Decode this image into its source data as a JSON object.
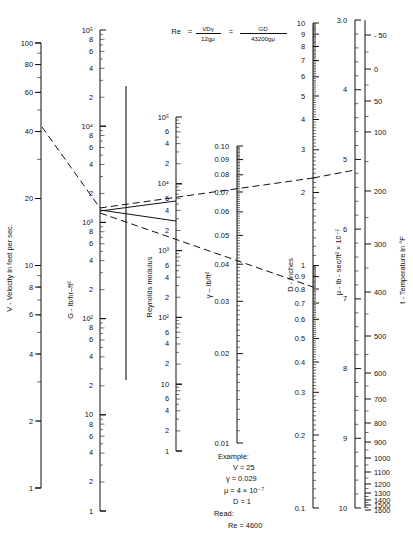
{
  "figure": {
    "kind": "nomograph",
    "formula": {
      "lhs": "Re",
      "eq1": "=",
      "num1": "VDγ",
      "den1": "12gμ",
      "eq2": "=",
      "num2": "GD",
      "den2": "43200gμ"
    }
  },
  "chart_data": {
    "type": "line",
    "subtitle": "Re = VDγ/12gμ = GD/43200gμ",
    "grid": false,
    "legend_position": "none",
    "axes": [
      {
        "id": "velocity",
        "name": "V - Velocity in feet per sec.",
        "label": "V - Velocity in feet per sec.",
        "scale": "log",
        "range": [
          1,
          100
        ],
        "direction": "top-is-max",
        "ticks": [
          "100",
          "80",
          "60",
          "40",
          "20",
          "10",
          "8",
          "6",
          "4",
          "2",
          "1"
        ],
        "tick_values": [
          100,
          80,
          60,
          40,
          20,
          10,
          8,
          6,
          4,
          2,
          1
        ]
      },
      {
        "id": "mass-velocity",
        "name": "G - lb/hr-ft2",
        "label": "G - lb/hr–ft²",
        "scale": "log",
        "range": [
          1,
          100000
        ],
        "direction": "top-is-max",
        "decade_labels": [
          "10⁵",
          "10⁴",
          "10³",
          "10²",
          "10"
        ],
        "intra_decade_labels": [
          "8",
          "6",
          "4",
          "2"
        ],
        "bottom_label": "1"
      },
      {
        "id": "reynolds",
        "name": "Reynolds modulus",
        "label": "Reynolds modulus",
        "scale": "log",
        "range": [
          1,
          100000
        ],
        "direction": "top-is-max",
        "decade_labels": [
          "10⁵",
          "10⁴",
          "10³",
          "10²",
          "10"
        ],
        "intra_decade_labels": [
          "6",
          "4",
          "2"
        ],
        "bottom_label": "1"
      },
      {
        "id": "specific-weight",
        "name": "gamma - lb/ft3",
        "label": "γ – lb/ft²",
        "scale": "log",
        "range": [
          0.01,
          0.1
        ],
        "direction": "top-is-max",
        "ticks": [
          "0.10",
          "0.09",
          "0.08",
          "0.07",
          "0.06",
          "0.05",
          "0.04",
          "0.03",
          "0.02",
          "0.01"
        ],
        "tick_values": [
          0.1,
          0.09,
          0.08,
          0.07,
          0.06,
          0.05,
          0.04,
          0.03,
          0.02,
          0.01
        ]
      },
      {
        "id": "diameter",
        "name": "D - Inches",
        "label": "D - Inches",
        "scale": "log",
        "range": [
          0.1,
          10
        ],
        "direction": "top-is-max",
        "ticks": [
          "10",
          "9",
          "8",
          "7",
          "6",
          "5",
          "4",
          "3",
          "2",
          "1",
          "0.9",
          "0.8",
          "0.7",
          "0.6",
          "0.5",
          "0.4",
          "0.3",
          "0.2",
          "0.1"
        ],
        "tick_values": [
          10,
          9,
          8,
          7,
          6,
          5,
          4,
          3,
          2,
          1,
          0.9,
          0.8,
          0.7,
          0.6,
          0.5,
          0.4,
          0.3,
          0.2,
          0.1
        ]
      },
      {
        "id": "viscosity",
        "name": "mu - lb-sec/ft2 x 10^-7",
        "label": "μ - lb - sec/ft² × 10⁻⁷",
        "scale": "linear",
        "range": [
          3.0,
          10
        ],
        "direction": "top-is-min",
        "ticks": [
          "3.0",
          "4",
          "5",
          "6",
          "7",
          "8",
          "9",
          "10"
        ],
        "tick_values": [
          3.0,
          4,
          5,
          6,
          7,
          8,
          9,
          10
        ]
      },
      {
        "id": "temperature",
        "name": "t - Temperature in F",
        "label": "t - Temperature in °F",
        "scale": "linear",
        "range": [
          -50,
          1600
        ],
        "direction": "top-is-min",
        "ticks": [
          "- 50",
          "0",
          "50",
          "100",
          "200",
          "300",
          "400",
          "500",
          "600",
          "700",
          "800",
          "900",
          "1000",
          "1100",
          "1200",
          "1300",
          "1400",
          "1500",
          "1600"
        ],
        "tick_values": [
          -50,
          0,
          50,
          100,
          200,
          300,
          400,
          500,
          600,
          700,
          800,
          900,
          1000,
          1100,
          1200,
          1300,
          1400,
          1500,
          1600
        ]
      }
    ],
    "construction_lines": [
      {
        "name": "velocity-to-mass-velocity",
        "style": "dashed",
        "from": "V = 25",
        "to": "G pivot"
      },
      {
        "name": "gamma-to-diameter-upper",
        "style": "dashed",
        "from": "G pivot",
        "to": "mu = 4"
      },
      {
        "name": "pivot-to-diameter",
        "style": "dashed",
        "from": "G pivot",
        "to": "D = 1"
      },
      {
        "name": "reynolds-result",
        "style": "solid",
        "from": "Reynolds modulus 4600",
        "to": "pivot axis"
      }
    ]
  },
  "example": {
    "heading": "Example:",
    "lines": [
      "V = 25",
      "γ = 0.029",
      "μ = 4 × 10⁻⁷",
      "D = 1"
    ],
    "read_heading": "Read:",
    "read_value": "Re = 4600"
  },
  "colors": {
    "ink": "#111111",
    "paper": "#ffffff"
  }
}
